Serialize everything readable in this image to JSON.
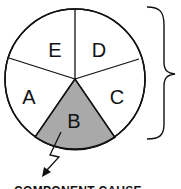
{
  "diagram": {
    "type": "sufficient-cause pie",
    "segments": [
      {
        "label": "A",
        "shaded": false
      },
      {
        "label": "B",
        "shaded": true
      },
      {
        "label": "C",
        "shaded": false
      },
      {
        "label": "D",
        "shaded": false
      },
      {
        "label": "E",
        "shaded": false
      }
    ],
    "caption": "COMPONENT CAUSE",
    "colors": {
      "shaded": "#a9a9a9",
      "stroke": "#111111",
      "background": "#ffffff"
    }
  }
}
